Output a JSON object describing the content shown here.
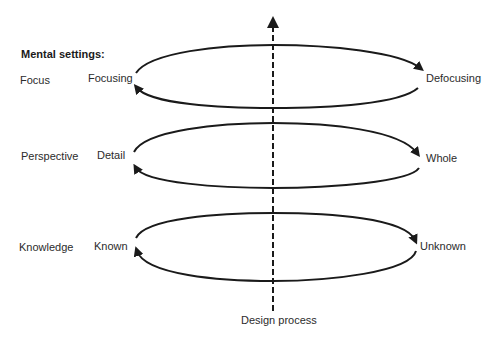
{
  "diagram": {
    "heading": "Mental settings:",
    "axis": {
      "label": "Design process",
      "direction": "up",
      "style": "dashed"
    },
    "rows": [
      {
        "category": "Focus",
        "left_pole": "Focusing",
        "right_pole": "Defocusing"
      },
      {
        "category": "Perspective",
        "left_pole": "Detail",
        "right_pole": "Whole"
      },
      {
        "category": "Knowledge",
        "left_pole": "Known",
        "right_pole": "Unknown"
      }
    ],
    "colors": {
      "stroke": "#1a1a1a",
      "text": "#2b2b2b",
      "background": "#ffffff"
    }
  }
}
